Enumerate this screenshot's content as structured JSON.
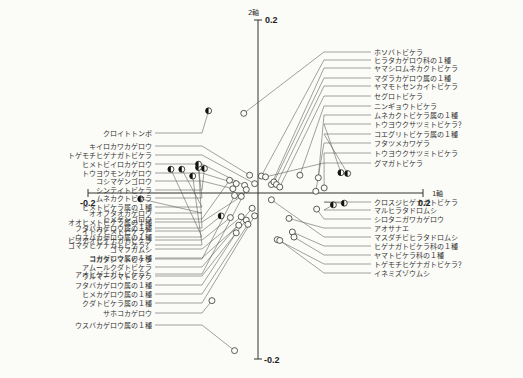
{
  "chart_data": {
    "type": "scatter",
    "title": "",
    "xlabel": "1軸",
    "ylabel": "2軸",
    "xlim": [
      -0.2,
      0.2
    ],
    "ylim": [
      -0.2,
      0.2
    ],
    "x_ticks": [
      "-0.2",
      "0.2"
    ],
    "y_ticks": [
      "0.2",
      "-0.2"
    ],
    "grid": false,
    "legend": "none",
    "marker_types": {
      "open": "open circle",
      "half": "half-filled circle"
    },
    "points_left_upper": [
      {
        "label": "クロイトトンボ",
        "x": -0.059,
        "y": 0.097,
        "marker": "half"
      },
      {
        "label": "キイロカワカゲロウ",
        "x": -0.01,
        "y": 0.021,
        "marker": "open"
      },
      {
        "label": "トゲモチヒゲナガトビケラ",
        "x": -0.004,
        "y": 0.011,
        "marker": "open"
      },
      {
        "label": "ヒメトビイロカゲロウ",
        "x": -0.016,
        "y": 0.009,
        "marker": "open"
      },
      {
        "label": "トウヨウモンカゲロウ",
        "x": -0.026,
        "y": 0.011,
        "marker": "open"
      },
      {
        "label": "コシマゲンゴロウ",
        "x": -0.03,
        "y": 0.005,
        "marker": "open"
      },
      {
        "label": "シンテイトビケラ",
        "x": -0.064,
        "y": 0.029,
        "marker": "half"
      },
      {
        "label": "ムネカクトビケラ",
        "x": -0.071,
        "y": 0.03,
        "marker": "half"
      },
      {
        "label": "ヒメトビケラ属の１種",
        "x": -0.091,
        "y": 0.028,
        "marker": "half"
      },
      {
        "label": "ヒメゲンゴロウ",
        "x": -0.034,
        "y": 0.015,
        "marker": "open"
      },
      {
        "label": "フタバカゲロウ属の１種",
        "x": -0.071,
        "y": 0.034,
        "marker": "half"
      },
      {
        "label": "ウスバカゲロウ属の１種",
        "x": -0.104,
        "y": 0.028,
        "marker": "half"
      },
      {
        "label": "ゴマダヒゲナガトビケラ？",
        "x": -0.078,
        "y": 0.02,
        "marker": "half"
      },
      {
        "label": "コガタシマトビケラ",
        "x": -0.028,
        "y": -0.003,
        "marker": "open"
      },
      {
        "label": "アオヒゲナガトビケラ？",
        "x": -0.014,
        "y": 0.004,
        "marker": "open"
      }
    ],
    "points_left_lower": [
      {
        "label": "オオフタオカゲロウ",
        "x": -0.14,
        "y": -0.007,
        "marker": "half"
      },
      {
        "label": "オオヒメトビケラ属の１種",
        "x": -0.02,
        "y": -0.004,
        "marker": "open"
      },
      {
        "label": "イトウヒメトビケラ？",
        "x": -0.044,
        "y": -0.027,
        "marker": "half"
      },
      {
        "label": "ビワアオヒゲナガトビケラ",
        "x": -0.033,
        "y": -0.029,
        "marker": "open"
      },
      {
        "label": "ゴマフガムシ",
        "x": -0.02,
        "y": -0.028,
        "marker": "open"
      },
      {
        "label": "コカゲロウ属の１種",
        "x": -0.023,
        "y": -0.038,
        "marker": "open"
      },
      {
        "label": "アムールクダトビケラ",
        "x": -0.007,
        "y": -0.018,
        "marker": "open"
      },
      {
        "label": "ウルマーシマトビケラ",
        "x": -0.014,
        "y": -0.032,
        "marker": "open"
      },
      {
        "label": "フタバカゲロウ属の１種",
        "x": -0.026,
        "y": -0.047,
        "marker": "open"
      },
      {
        "label": "ヒメカゲロウ属の１種",
        "x": -0.012,
        "y": -0.037,
        "marker": "open"
      },
      {
        "label": "クダトビケラ属の１種",
        "x": -0.004,
        "y": -0.027,
        "marker": "open"
      },
      {
        "label": "サホコカゲロウ",
        "x": -0.055,
        "y": -0.127,
        "marker": "open"
      },
      {
        "label": "ウスバカゲロウ属の１種",
        "x": -0.028,
        "y": -0.186,
        "marker": "open"
      }
    ],
    "points_right_upper": [
      {
        "label": "ホソバトビケラ",
        "x": -0.017,
        "y": 0.094,
        "marker": "open"
      },
      {
        "label": "ヒラタカゲロウ科の１種",
        "x": 0.004,
        "y": 0.02,
        "marker": "open"
      },
      {
        "label": "ヤマシロムネカクトビケラ",
        "x": 0.016,
        "y": 0.01,
        "marker": "open"
      },
      {
        "label": "マダラカゲロウ属の１種",
        "x": 0.019,
        "y": 0.013,
        "marker": "open"
      },
      {
        "label": "ヤマモトセンカイトビケラ",
        "x": 0.022,
        "y": 0.01,
        "marker": "open"
      },
      {
        "label": "セグロトビケラ",
        "x": 0.026,
        "y": 0.007,
        "marker": "open"
      },
      {
        "label": "ニンギョウトビケラ",
        "x": 0.05,
        "y": 0.021,
        "marker": "open"
      },
      {
        "label": "ムネカクトビケラ属の１種",
        "x": 0.072,
        "y": 0.018,
        "marker": "open"
      },
      {
        "label": "トウヨウクサツミトビケラ？",
        "x": 0.099,
        "y": 0.024,
        "marker": "half"
      },
      {
        "label": "コエグリトビケラ属の１種",
        "x": 0.107,
        "y": 0.023,
        "marker": "half"
      },
      {
        "label": "フタツメカワゲラ",
        "x": 0.069,
        "y": 0.002,
        "marker": "open"
      },
      {
        "label": "トウヨウクサツミトビケラ",
        "x": 0.079,
        "y": 0.006,
        "marker": "open"
      },
      {
        "label": "グマガトビケラ",
        "x": 0.009,
        "y": 0.019,
        "marker": "open"
      }
    ],
    "points_right_lower": [
      {
        "label": "クロスジヒゲナガトビケラ",
        "x": 0.103,
        "y": -0.012,
        "marker": "half"
      },
      {
        "label": "マルヒラタドロムシ",
        "x": 0.09,
        "y": -0.014,
        "marker": "half"
      },
      {
        "label": "シロタニガワカゲロウ",
        "x": 0.07,
        "y": -0.019,
        "marker": "open"
      },
      {
        "label": "アオサナエ",
        "x": 0.037,
        "y": -0.03,
        "marker": "open"
      },
      {
        "label": "マスダチビヒラタドロムシ",
        "x": 0.016,
        "y": -0.008,
        "marker": "open"
      },
      {
        "label": "ヒゲナガトビケラ科の１種",
        "x": 0.041,
        "y": -0.046,
        "marker": "open"
      },
      {
        "label": "ヤマトビケラ科の１種",
        "x": 0.043,
        "y": -0.052,
        "marker": "open"
      },
      {
        "label": "トゲモチヒゲナガトビケラ？",
        "x": 0.023,
        "y": -0.055,
        "marker": "open"
      },
      {
        "label": "イネミズゾウムシ",
        "x": 0.026,
        "y": -0.056,
        "marker": "open"
      }
    ]
  },
  "axes": {
    "axis1_name": "1軸",
    "axis2_name": "2軸",
    "x_neg_tick": "-0.2",
    "x_pos_tick": "0.2",
    "y_pos_tick": "0.2",
    "y_neg_tick": "-0.2"
  },
  "labels_left": [
    "クロイトトンボ",
    "キイロカワカゲロウ",
    "トゲモチヒゲナガトビケラ",
    "ヒメトビイロカゲロウ",
    "トウヨウモンカゲロウ",
    "コシマゲンゴロウ",
    "シンテイトビケラ",
    "ムネカクトビケラ",
    "ヒメトビケラ属の１種",
    "ヒメゲンゴロウ",
    "フタバカゲロウ属の１種",
    "ウスバカゲロウ属の１種",
    "ゴマダヒゲナガトビケラ？",
    "コガタシマトビケラ",
    "アオヒゲナガトビケラ？",
    "オオフタオカゲロウ",
    "オオヒメトビケラ属の１種",
    "イトウヒメトビケラ？",
    "ビワアオヒゲナガトビケラ",
    "ゴマフガムシ",
    "コカゲロウ属の１種",
    "アムールクダトビケラ",
    "ウルマーシマトビケラ",
    "フタバカゲロウ属の１種",
    "ヒメカゲロウ属の１種",
    "クダトビケラ属の１種",
    "サホコカゲロウ",
    "ウスバカゲロウ属の１種"
  ],
  "labels_right": [
    "ホソバトビケラ",
    "ヒラタカゲロウ科の１種",
    "ヤマシロムネカクトビケラ",
    "マダラカゲロウ属の１種",
    "ヤマモトセンカイトビケラ",
    "セグロトビケラ",
    "ニンギョウトビケラ",
    "ムネカクトビケラ属の１種",
    "トウヨウクサツミトビケラ？",
    "コエグリトビケラ属の１種",
    "フタツメカワゲラ",
    "トウヨウクサツミトビケラ",
    "グマガトビケラ",
    "クロスジヒゲナガトビケラ",
    "マルヒラタドロムシ",
    "シロタニガワカゲロウ",
    "アオサナエ",
    "マスダチビヒラタドロムシ",
    "ヒゲナガトビケラ科の１種",
    "ヤマトビケラ科の１種",
    "トゲモチヒゲナガトビケラ？",
    "イネミズゾウムシ"
  ]
}
